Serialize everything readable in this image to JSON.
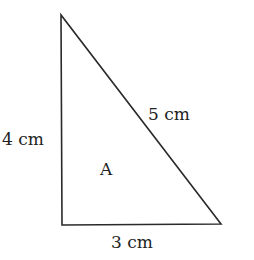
{
  "diagram": {
    "shape": "right-triangle",
    "stroke_color": "#2a2a2a",
    "vertices": {
      "top": [
        61,
        15
      ],
      "bottom_left": [
        62,
        225
      ],
      "bottom_right": [
        221,
        224
      ]
    },
    "labels": {
      "left_side": "4 cm",
      "hypotenuse": "5 cm",
      "bottom_side": "3 cm",
      "region": "A"
    }
  }
}
